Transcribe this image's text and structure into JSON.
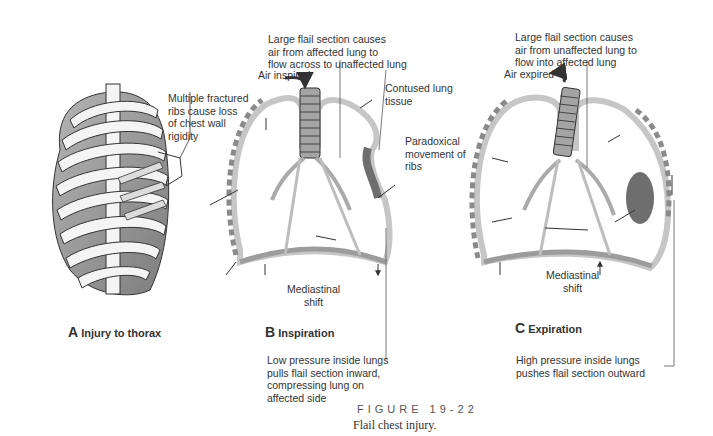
{
  "figure": {
    "number_label": "FIGURE 19-22",
    "caption": "Flail chest injury."
  },
  "panels": [
    {
      "letter": "A",
      "title": "Injury to thorax",
      "annotations": [
        {
          "id": "fractured-ribs",
          "text": "Multiple fractured\nribs cause loss\nof chest wall\nrigidity"
        }
      ]
    },
    {
      "letter": "B",
      "title": "Inspiration",
      "annotations": [
        {
          "id": "flail-airflow",
          "text": "Large flail section causes\nair from affected lung to\nflow across to unaffected lung"
        },
        {
          "id": "air-direction",
          "text": "Air inspired"
        },
        {
          "id": "contused-tissue",
          "text": "Contused lung\ntissue"
        },
        {
          "id": "paradoxical",
          "text": "Paradoxical\nmovement of\nribs"
        },
        {
          "id": "mediastinal-shift",
          "text": "Mediastinal\nshift"
        },
        {
          "id": "pressure-note",
          "text": "Low pressure inside lungs\npulls flail section inward,\ncompressing lung on\naffected side"
        }
      ]
    },
    {
      "letter": "C",
      "title": "Expiration",
      "annotations": [
        {
          "id": "flail-airflow",
          "text": "Large flail section causes\nair from unaffected lung to\nflow into affected lung"
        },
        {
          "id": "air-direction",
          "text": "Air expired"
        },
        {
          "id": "mediastinal-shift",
          "text": "Mediastinal\nshift"
        },
        {
          "id": "pressure-note",
          "text": "High pressure inside lungs\npushes flail section outward"
        }
      ]
    }
  ],
  "colors": {
    "outline": "#3a3a3a",
    "pleura_fill": "#c8c8c8",
    "chest_wall": "#8a8a8a",
    "contusion": "#6e6e6e",
    "rib_fill": "#f4f4f4",
    "cavity_shade": "#9a9a9a"
  }
}
